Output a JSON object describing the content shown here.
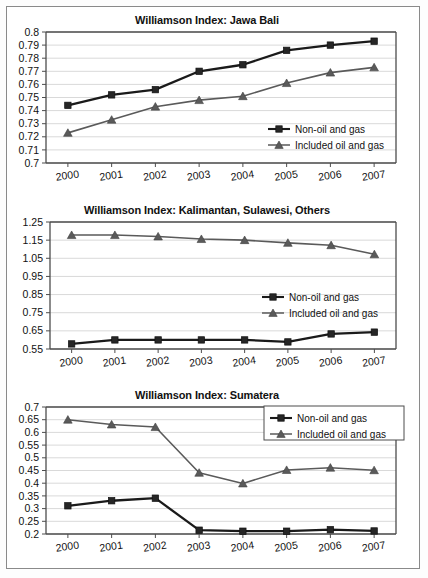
{
  "figure": {
    "panel_count": 3,
    "series_names": [
      "Non-oil and gas",
      "Included oil and gas"
    ],
    "legend": {
      "non_oil_label": "Non-oil and gas",
      "included_label": "Included oil and gas",
      "marker_non_oil": "square-marker",
      "marker_included": "triangle-marker"
    },
    "colors": {
      "non_oil_line": "#1a1a1a",
      "included_line": "#5a5a5a",
      "gridline": "#d9d9d9",
      "axis": "#4d4d4d",
      "frame": "#8a8a8a",
      "background": "#ffffff",
      "text": "#111111"
    }
  },
  "chart_data": [
    {
      "type": "line",
      "title": "Williamson Index: Jawa Bali",
      "xlabel": "",
      "ylabel": "",
      "categories": [
        "2000",
        "2001",
        "2002",
        "2003",
        "2004",
        "2005",
        "2006",
        "2007"
      ],
      "ylim": [
        0.7,
        0.8
      ],
      "yticks": [
        0.7,
        0.71,
        0.72,
        0.73,
        0.74,
        0.75,
        0.76,
        0.77,
        0.78,
        0.79,
        0.8
      ],
      "ytick_labels": [
        "0.7",
        "0.71",
        "0.72",
        "0.73",
        "0.74",
        "0.75",
        "0.76",
        "0.77",
        "0.78",
        "0.79",
        "0.8"
      ],
      "grid": true,
      "legend_position": "inside-right-lower",
      "series": [
        {
          "name": "Non-oil and gas",
          "marker": "square",
          "values": [
            0.744,
            0.752,
            0.756,
            0.77,
            0.775,
            0.786,
            0.79,
            0.793
          ]
        },
        {
          "name": "Included oil and gas",
          "marker": "triangle",
          "values": [
            0.723,
            0.733,
            0.743,
            0.748,
            0.751,
            0.761,
            0.769,
            0.773
          ]
        }
      ]
    },
    {
      "type": "line",
      "title": "Williamson Index: Kalimantan, Sulawesi, Others",
      "xlabel": "",
      "ylabel": "",
      "categories": [
        "2000",
        "2001",
        "2002",
        "2003",
        "2004",
        "2005",
        "2006",
        "2007"
      ],
      "ylim": [
        0.55,
        1.25
      ],
      "yticks": [
        0.55,
        0.65,
        0.75,
        0.85,
        0.95,
        1.05,
        1.15,
        1.25
      ],
      "ytick_labels": [
        "0.55",
        "0.65",
        "0.75",
        "0.85",
        "0.95",
        "1.05",
        "1.15",
        "1.25"
      ],
      "grid": true,
      "legend_position": "inside-right-middle",
      "series": [
        {
          "name": "Non-oil and gas",
          "marker": "square",
          "values": [
            0.578,
            0.6,
            0.6,
            0.6,
            0.6,
            0.589,
            0.633,
            0.643
          ]
        },
        {
          "name": "Included oil and gas",
          "marker": "triangle",
          "values": [
            1.178,
            1.178,
            1.17,
            1.156,
            1.15,
            1.135,
            1.122,
            1.072
          ]
        }
      ]
    },
    {
      "type": "line",
      "title": "Williamson Index: Sumatera",
      "xlabel": "",
      "ylabel": "",
      "categories": [
        "2000",
        "2001",
        "2002",
        "2003",
        "2004",
        "2005",
        "2006",
        "2007"
      ],
      "ylim": [
        0.2,
        0.7
      ],
      "yticks": [
        0.2,
        0.25,
        0.3,
        0.35,
        0.4,
        0.45,
        0.5,
        0.55,
        0.6,
        0.65,
        0.7
      ],
      "ytick_labels": [
        "0.2",
        "0.25",
        "0.3",
        "0.35",
        "0.4",
        "0.45",
        "0.5",
        "0.55",
        "0.6",
        "0.65",
        "0.7"
      ],
      "grid": true,
      "legend_position": "inside-right-top",
      "series": [
        {
          "name": "Non-oil and gas",
          "marker": "square",
          "values": [
            0.311,
            0.331,
            0.341,
            0.215,
            0.211,
            0.211,
            0.217,
            0.212
          ]
        },
        {
          "name": "Included oil and gas",
          "marker": "triangle",
          "values": [
            0.65,
            0.631,
            0.621,
            0.441,
            0.399,
            0.452,
            0.461,
            0.451
          ]
        }
      ]
    }
  ]
}
